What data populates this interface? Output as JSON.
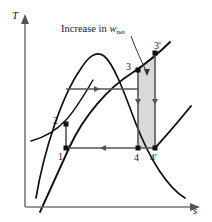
{
  "figure": {
    "type": "T-s diagram",
    "caption": {
      "prefix": "Increase in ",
      "symbol": "w",
      "subscript": "net"
    },
    "axes": {
      "y_label": "T",
      "x_label": "s",
      "origin": [
        25,
        207
      ],
      "y_top": [
        25,
        16
      ],
      "x_right": [
        199,
        207
      ]
    },
    "colors": {
      "curve": "#111111",
      "process_line": "#555555",
      "shaded_area": "#d4d4d4",
      "shade_border": "#555555",
      "axis": "#777777",
      "text": "#1a1a1a",
      "marker": "#111111"
    },
    "states": [
      {
        "id": "1",
        "label": "1",
        "x": 66,
        "y": 148,
        "label_dx": -8,
        "label_dy": 8
      },
      {
        "id": "2",
        "label": "2",
        "x": 66,
        "y": 124,
        "label_dx": -10,
        "label_dy": -2
      },
      {
        "id": "3",
        "label": "3",
        "x": 138,
        "y": 70,
        "label_dx": -11,
        "label_dy": -2
      },
      {
        "id": "3p",
        "label": "3'",
        "x": 155,
        "y": 53,
        "label_dx": 1,
        "label_dy": -6
      },
      {
        "id": "4",
        "label": "4",
        "x": 138,
        "y": 148,
        "label_dx": -3,
        "label_dy": 12
      },
      {
        "id": "4p",
        "label": "4'",
        "x": 155,
        "y": 148,
        "label_dx": -2,
        "label_dy": 12
      }
    ],
    "processes": [
      {
        "from": "1",
        "to": "2",
        "kind": "vertical",
        "arrow": false
      },
      {
        "from": "2",
        "to": "3",
        "kind": "horizontal",
        "arrow": "right",
        "arrow_at": 0.45
      },
      {
        "from": "3",
        "to": "4",
        "kind": "vertical",
        "arrow": "down",
        "arrow_at": 0.45
      },
      {
        "from": "4",
        "to": "1",
        "kind": "horizontal",
        "arrow": "left",
        "arrow_at": 0.5
      },
      {
        "from": "3p",
        "to": "4p",
        "kind": "vertical",
        "arrow": false
      },
      {
        "from": "3",
        "to": "3p",
        "kind": "diagonal",
        "arrow": false
      }
    ],
    "shaded_region": {
      "name": "increase-in-net-work",
      "vertices": [
        [
          138,
          70
        ],
        [
          155,
          53
        ],
        [
          155,
          148
        ],
        [
          138,
          148
        ]
      ]
    },
    "dome": {
      "name": "saturation-dome",
      "peak": [
        96,
        52
      ],
      "left_foot": [
        36,
        198
      ],
      "right_foot": [
        185,
        198
      ]
    },
    "leader_line": {
      "from": [
        131,
        36
      ],
      "to": [
        147,
        75
      ]
    }
  }
}
